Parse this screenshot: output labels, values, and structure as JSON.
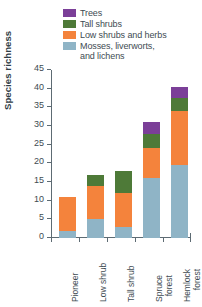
{
  "chart_data": {
    "type": "bar",
    "subtype": "stacked-bar",
    "title": "",
    "xlabel": "",
    "ylabel": "Species richness",
    "ylim": [
      0,
      45
    ],
    "yticks": [
      0,
      5,
      10,
      15,
      20,
      25,
      30,
      35,
      40,
      45
    ],
    "grid": false,
    "legend_position": "top-right",
    "categories": [
      "Pioneer",
      "Low shrub",
      "Tall shrub",
      "Spruce\nforest",
      "Hemlock\nforest"
    ],
    "series": [
      {
        "name": "Mosses, liverworts,\nand lichens",
        "color": "#8FB4C6",
        "values": [
          2,
          5,
          3,
          16,
          19.5
        ]
      },
      {
        "name": "Low shrubs and herbs",
        "color": "#F4833C",
        "values": [
          9,
          9,
          9,
          8,
          14.5
        ]
      },
      {
        "name": "Tall shrubs",
        "color": "#4E7A38",
        "values": [
          0,
          3,
          6,
          4,
          3.5
        ]
      },
      {
        "name": "Trees",
        "color": "#7B3F98",
        "values": [
          0,
          0,
          0,
          3,
          3
        ]
      }
    ],
    "totals": [
      11,
      17,
      18,
      31,
      40.5
    ]
  },
  "legend": {
    "items": [
      {
        "label": "Trees",
        "color": "#7B3F98"
      },
      {
        "label": "Tall shrubs",
        "color": "#4E7A38"
      },
      {
        "label": "Low shrubs and herbs",
        "color": "#F4833C"
      },
      {
        "label": "Mosses, liverworts,\nand lichens",
        "color": "#8FB4C6"
      }
    ]
  },
  "axes": {
    "y": {
      "title": "Species richness",
      "ticks": [
        "0",
        "5",
        "10",
        "15",
        "20",
        "25",
        "30",
        "35",
        "40",
        "45"
      ]
    },
    "x": {
      "ticks": [
        "Pioneer",
        "Low shrub",
        "Tall shrub",
        "Spruce\nforest",
        "Hemlock\nforest"
      ]
    }
  }
}
